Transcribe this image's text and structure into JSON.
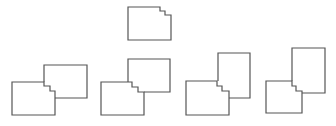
{
  "diagram": {
    "stroke_color": "#555555",
    "background": "#ffffff",
    "reference": {
      "points": "128,7 160,7 160,11 165,11 165,15 171,15 171,40 128,40"
    },
    "options": [
      {
        "left": "12,82 44,82 44,86 50,86 50,91 55,91 55,115 12,115",
        "right": "44,82 44,65 87,65 87,98 55,98"
      },
      {
        "left": "101,82 132,82 132,87 138,87 138,92 144,92 144,115 101,115",
        "right": "128,82 128,59 170,59 170,92 144,92"
      },
      {
        "left": "186,81 217,81 217,86 222,86 222,91 229,91 229,115 186,115",
        "right": "218,81 218,53 250,53 250,98 229,98"
      },
      {
        "left": "266,81 292,81 292,86 296,86 296,91 302,91 302,113 266,113",
        "right": "292,81 292,48 325,48 325,93 302,93"
      }
    ]
  }
}
